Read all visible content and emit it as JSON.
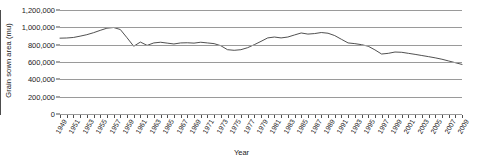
{
  "chart_data": {
    "type": "line",
    "title": "",
    "xlabel": "Year",
    "ylabel": "Grain sown area (mu)",
    "ylim": [
      0,
      1200000
    ],
    "xlim": [
      1949,
      2009
    ],
    "grid": true,
    "legend": "none",
    "y_ticks": [
      "1,200,000",
      "1,000,000",
      "800,000",
      "600,000",
      "400,000",
      "200,000",
      "0"
    ],
    "y_tick_values": [
      1200000,
      1000000,
      800000,
      600000,
      400000,
      200000,
      0
    ],
    "x_tick_labels": [
      "1949",
      "1951",
      "1953",
      "1955",
      "1957",
      "1959",
      "1961",
      "1963",
      "1965",
      "1967",
      "1969",
      "1971",
      "1973",
      "1975",
      "1977",
      "1979",
      "1981",
      "1983",
      "1985",
      "1987",
      "1989",
      "1991",
      "1993",
      "1995",
      "1997",
      "1999",
      "2001",
      "2003",
      "2005",
      "2007",
      "2009"
    ],
    "series": [
      {
        "name": "Grain sown area",
        "color": "#3c3c3c",
        "x": [
          1949,
          1950,
          1951,
          1952,
          1953,
          1954,
          1955,
          1956,
          1957,
          1958,
          1959,
          1960,
          1961,
          1962,
          1963,
          1964,
          1965,
          1966,
          1967,
          1968,
          1969,
          1970,
          1971,
          1972,
          1973,
          1974,
          1975,
          1976,
          1977,
          1978,
          1979,
          1980,
          1981,
          1982,
          1983,
          1984,
          1985,
          1986,
          1987,
          1988,
          1989,
          1990,
          1991,
          1992,
          1993,
          1994,
          1995,
          1996,
          1997,
          1998,
          1999,
          2000,
          2001,
          2002,
          2003,
          2004,
          2005,
          2006,
          2007,
          2008,
          2009
        ],
        "values": [
          875000,
          877000,
          883000,
          898000,
          915000,
          938000,
          965000,
          990000,
          998000,
          975000,
          880000,
          782000,
          830000,
          792000,
          820000,
          828000,
          818000,
          808000,
          820000,
          822000,
          818000,
          828000,
          820000,
          812000,
          788000,
          742000,
          735000,
          742000,
          765000,
          800000,
          838000,
          878000,
          888000,
          878000,
          888000,
          912000,
          935000,
          922000,
          928000,
          940000,
          932000,
          905000,
          862000,
          820000,
          812000,
          800000,
          782000,
          740000,
          692000,
          700000,
          715000,
          712000,
          700000,
          688000,
          675000,
          662000,
          648000,
          632000,
          612000,
          592000,
          572000
        ]
      }
    ],
    "annotations": []
  }
}
